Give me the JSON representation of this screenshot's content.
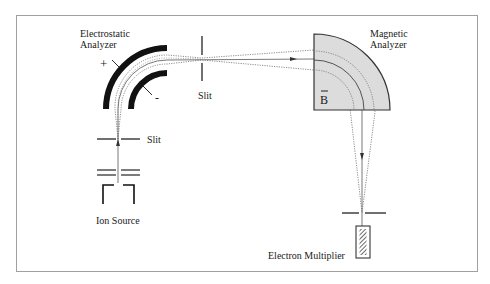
{
  "diagram": {
    "labels": {
      "electrostatic_analyzer_line1": "Electrostatic",
      "electrostatic_analyzer_line2": "Analyzer",
      "plus_sign": "+",
      "minus_sign": "-",
      "slit_top": "Slit",
      "slit_left": "Slit",
      "magnetic_analyzer_line1": "Magnetic",
      "magnetic_analyzer_line2": "Analyzer",
      "b_field": "B",
      "b_vector_mark": "~",
      "ion_source": "Ion Source",
      "electron_multiplier": "Electron Multiplier"
    },
    "components": [
      {
        "id": "ion-source",
        "name": "Ion Source"
      },
      {
        "id": "source-slit",
        "name": "Slit"
      },
      {
        "id": "electrostatic-analyzer",
        "name": "Electrostatic Analyzer",
        "plates": [
          "+",
          "-"
        ]
      },
      {
        "id": "intermediate-slit",
        "name": "Slit"
      },
      {
        "id": "magnetic-analyzer",
        "name": "Magnetic Analyzer",
        "field": "B"
      },
      {
        "id": "detector-slit",
        "name": "Slit"
      },
      {
        "id": "electron-multiplier",
        "name": "Electron Multiplier"
      }
    ],
    "colors": {
      "frame": "#a0a0a0",
      "ink": "#1a1a1a",
      "magnet_fill": "#dcdcdc",
      "beam_dotted": "#707070"
    }
  }
}
